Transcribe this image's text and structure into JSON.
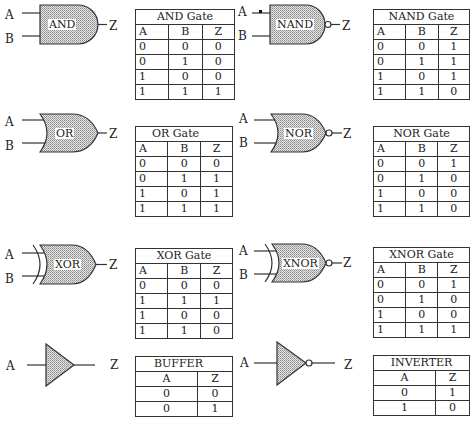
{
  "diagram": {
    "gates": [
      {
        "id": "and",
        "name": "AND",
        "inputs": [
          "A",
          "B"
        ],
        "output": "Z",
        "table": {
          "title": "AND Gate",
          "headers": [
            "A",
            "B",
            "Z"
          ],
          "rows": [
            [
              "0",
              "0",
              "0"
            ],
            [
              "0",
              "1",
              "0"
            ],
            [
              "1",
              "0",
              "0"
            ],
            [
              "1",
              "1",
              "1"
            ]
          ]
        }
      },
      {
        "id": "nand",
        "name": "NAND",
        "inputs": [
          "A",
          "B"
        ],
        "output": "Z",
        "table": {
          "title": "NAND Gate",
          "headers": [
            "A",
            "B",
            "Z"
          ],
          "rows": [
            [
              "0",
              "0",
              "1"
            ],
            [
              "0",
              "1",
              "1"
            ],
            [
              "1",
              "0",
              "1"
            ],
            [
              "1",
              "1",
              "0"
            ]
          ]
        }
      },
      {
        "id": "or",
        "name": "OR",
        "inputs": [
          "A",
          "B"
        ],
        "output": "Z",
        "table": {
          "title": "OR Gate",
          "headers": [
            "A",
            "B",
            "Z"
          ],
          "rows": [
            [
              "0",
              "0",
              "0"
            ],
            [
              "0",
              "1",
              "1"
            ],
            [
              "1",
              "0",
              "1"
            ],
            [
              "1",
              "1",
              "1"
            ]
          ]
        }
      },
      {
        "id": "nor",
        "name": "NOR",
        "inputs": [
          "A",
          "B"
        ],
        "output": "Z",
        "table": {
          "title": "NOR Gate",
          "headers": [
            "A",
            "B",
            "Z"
          ],
          "rows": [
            [
              "0",
              "0",
              "1"
            ],
            [
              "0",
              "1",
              "0"
            ],
            [
              "1",
              "0",
              "0"
            ],
            [
              "1",
              "1",
              "0"
            ]
          ]
        }
      },
      {
        "id": "xor",
        "name": "XOR",
        "inputs": [
          "A",
          "B"
        ],
        "output": "Z",
        "table": {
          "title": "XOR Gate",
          "headers": [
            "A",
            "B",
            "Z"
          ],
          "rows": [
            [
              "0",
              "0",
              "0"
            ],
            [
              "1",
              "1",
              "1"
            ],
            [
              "1",
              "0",
              "0"
            ],
            [
              "1",
              "1",
              "0"
            ]
          ]
        }
      },
      {
        "id": "xnor",
        "name": "XNOR",
        "inputs": [
          "A",
          "B"
        ],
        "output": "Z",
        "table": {
          "title": "XNOR Gate",
          "headers": [
            "A",
            "B",
            "Z"
          ],
          "rows": [
            [
              "0",
              "0",
              "1"
            ],
            [
              "0",
              "1",
              "0"
            ],
            [
              "1",
              "0",
              "0"
            ],
            [
              "1",
              "1",
              "1"
            ]
          ]
        }
      },
      {
        "id": "buffer",
        "name": "",
        "inputs": [
          "A"
        ],
        "output": "Z",
        "table": {
          "title": "BUFFER",
          "headers": [
            "A",
            "Z"
          ],
          "rows": [
            [
              "0",
              "0"
            ],
            [
              "0",
              "1"
            ]
          ]
        }
      },
      {
        "id": "inverter",
        "name": "",
        "inputs": [
          "A"
        ],
        "output": "Z",
        "table": {
          "title": "INVERTER",
          "headers": [
            "A",
            "Z"
          ],
          "rows": [
            [
              "0",
              "1"
            ],
            [
              "1",
              "0"
            ]
          ]
        }
      }
    ],
    "colors": {
      "stroke": "#333333",
      "fill_pattern": "#9a9a9a",
      "background": "#ffffff"
    }
  }
}
